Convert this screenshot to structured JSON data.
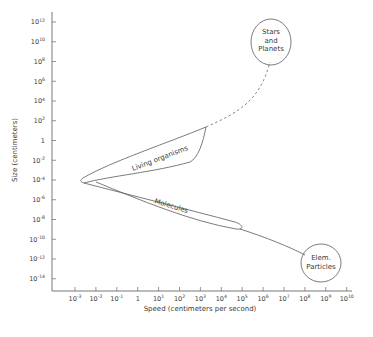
{
  "chart_data": {
    "type": "scatter",
    "title": "",
    "xlabel": "Speed (centimeters per second)",
    "ylabel": "Size (centimeters)",
    "x_scale": "log",
    "y_scale": "log",
    "xlim_exponents": [
      -3,
      10
    ],
    "ylim_exponents": [
      -14,
      12
    ],
    "grid": false,
    "x_ticks": [
      {
        "base": "10",
        "exp": "-3"
      },
      {
        "base": "10",
        "exp": "-2"
      },
      {
        "base": "10",
        "exp": "-1"
      },
      {
        "base": "1",
        "exp": ""
      },
      {
        "base": "10",
        "exp": "1"
      },
      {
        "base": "10",
        "exp": "2"
      },
      {
        "base": "10",
        "exp": "3"
      },
      {
        "base": "10",
        "exp": "4"
      },
      {
        "base": "10",
        "exp": "5"
      },
      {
        "base": "10",
        "exp": "6"
      },
      {
        "base": "10",
        "exp": "7"
      },
      {
        "base": "10",
        "exp": "8"
      },
      {
        "base": "10",
        "exp": "9"
      },
      {
        "base": "10",
        "exp": "10"
      }
    ],
    "y_ticks": [
      {
        "base": "10",
        "exp": "12"
      },
      {
        "base": "10",
        "exp": "10"
      },
      {
        "base": "10",
        "exp": "8"
      },
      {
        "base": "10",
        "exp": "6"
      },
      {
        "base": "10",
        "exp": "4"
      },
      {
        "base": "10",
        "exp": "2"
      },
      {
        "base": "1",
        "exp": ""
      },
      {
        "base": "10",
        "exp": "-2"
      },
      {
        "base": "10",
        "exp": "-4"
      },
      {
        "base": "10",
        "exp": "-6"
      },
      {
        "base": "10",
        "exp": "-8"
      },
      {
        "base": "10",
        "exp": "-10"
      },
      {
        "base": "10",
        "exp": "-12"
      },
      {
        "base": "10",
        "exp": "-14"
      }
    ],
    "regions": [
      {
        "name": "Stars and Planets",
        "label_lines": [
          "Stars",
          "and",
          "Planets"
        ],
        "shape": "ellipse",
        "center_log": {
          "speed": 6.5,
          "size": 9
        },
        "connector": "dashed line to Living organisms tip (~10^3 cm/s, ~10^1.5 cm)"
      },
      {
        "name": "Living organisms",
        "label_lines": [
          "Living organisms"
        ],
        "shape": "band",
        "speed_range_log": [
          -2.3,
          3
        ],
        "size_range_log": [
          -4.5,
          1.5
        ]
      },
      {
        "name": "Molecules",
        "label_lines": [
          "Molecules"
        ],
        "shape": "band",
        "speed_range_log": [
          -2.3,
          4.9
        ],
        "size_range_log": [
          -8.3,
          -4
        ]
      },
      {
        "name": "Elem. Particles",
        "label_lines": [
          "Elem.",
          "Particles"
        ],
        "shape": "ellipse",
        "center_log": {
          "speed": 8.6,
          "size": -12
        },
        "connector": "solid line from Molecules tip"
      }
    ]
  }
}
